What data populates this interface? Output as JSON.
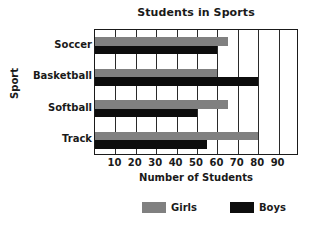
{
  "chart_data": {
    "type": "bar",
    "orientation": "horizontal",
    "title": "Students in Sports",
    "xlabel": "Number of Students",
    "ylabel": "Sport",
    "categories": [
      "Soccer",
      "Basketball",
      "Softball",
      "Track"
    ],
    "series": [
      {
        "name": "Girls",
        "color": "#808080",
        "values": [
          65,
          60,
          65,
          80
        ]
      },
      {
        "name": "Boys",
        "color": "#0d0d0d",
        "values": [
          60,
          80,
          50,
          55
        ]
      }
    ],
    "xlim": [
      0,
      100
    ],
    "xticks": [
      10,
      20,
      30,
      40,
      50,
      60,
      70,
      80,
      90
    ],
    "xtick_labels": [
      "10",
      "20",
      "30",
      "40",
      "50",
      "60",
      "70",
      "80",
      "90"
    ],
    "grid": "vertical",
    "legend_position": "bottom",
    "legend_entries": [
      "Girls",
      "Boys"
    ]
  }
}
